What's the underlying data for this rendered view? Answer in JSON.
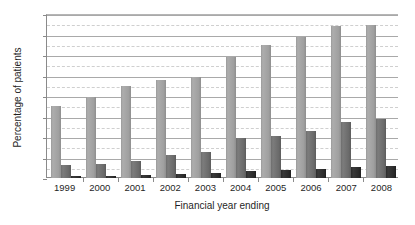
{
  "chart_data": {
    "type": "bar",
    "title": "",
    "subtitle": "",
    "xlabel": "Financial year ending",
    "ylabel": "Percentage of patients",
    "categories": [
      "1999",
      "2000",
      "2001",
      "2002",
      "2003",
      "2004",
      "2005",
      "2006",
      "2007",
      "2008"
    ],
    "series": [
      {
        "name": "series-1",
        "color": "#a0a0a0",
        "values": [
          7.0,
          7.9,
          9.0,
          9.6,
          9.9,
          11.8,
          13.0,
          13.8,
          14.8,
          14.9
        ]
      },
      {
        "name": "series-2",
        "color": "#6e6e6e",
        "values": [
          1.3,
          1.4,
          1.7,
          2.2,
          2.5,
          3.9,
          4.1,
          4.6,
          5.5,
          5.8
        ]
      },
      {
        "name": "series-3",
        "color": "#2b2b2b",
        "values": [
          0.2,
          0.2,
          0.25,
          0.4,
          0.5,
          0.65,
          0.75,
          0.85,
          1.1,
          1.2
        ]
      }
    ],
    "ylim": [
      0,
      16
    ],
    "ytick_values": [
      0,
      2,
      4,
      6,
      8,
      10,
      12,
      14,
      16
    ],
    "ytick_labels": [
      "0%",
      "2%",
      "4%",
      "6%",
      "8%",
      "10%",
      "12%",
      "14%",
      "16%"
    ],
    "minor_gridline_values": [
      1,
      3,
      5,
      7,
      9,
      11,
      13,
      15
    ],
    "grid": true,
    "legend": false,
    "legend_position": "none"
  }
}
